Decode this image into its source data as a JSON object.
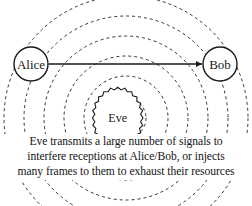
{
  "figure": {
    "background_color": "#ffffff",
    "stroke_color": "#1a1a1a",
    "dash_color": "#333333",
    "width": 252,
    "height": 206
  },
  "nodes": {
    "alice": {
      "label": "Alice",
      "cx": 31,
      "cy": 64,
      "r": 17
    },
    "bob": {
      "label": "Bob",
      "cx": 220,
      "cy": 64,
      "r": 17
    },
    "eve": {
      "label": "Eve",
      "cx": 126,
      "cy": 118,
      "r_outer": 17,
      "r_inner": 12.5,
      "points": 16
    }
  },
  "link": {
    "name": "alice-bob-link",
    "from": "Alice",
    "to": "Bob",
    "style": "double-headed-arrow",
    "x1": 48,
    "x2": 203,
    "y": 64
  },
  "waves": {
    "name": "eve-signal-waves",
    "style": "dashed-concentric-circles",
    "center_x": 126,
    "center_y": 118,
    "radii": [
      20,
      42,
      62,
      82,
      102,
      122
    ],
    "dash_pattern": "3 3"
  },
  "caption": {
    "lines": [
      "Eve transmits a large number of signals to",
      "interfere receptions at Alice/Bob, or injects",
      "many frames to them to exhaust their resources"
    ]
  }
}
